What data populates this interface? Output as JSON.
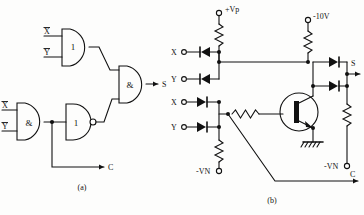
{
  "figure": {
    "caption_a": "(a)",
    "caption_b": "(b)"
  },
  "diagram_a": {
    "name": "half-adder-logic-diagram",
    "inputs": [
      {
        "label": "X",
        "overline": true,
        "gate": "or-top"
      },
      {
        "label": "Y",
        "overline": true,
        "gate": "or-top"
      },
      {
        "label": "X",
        "overline": false,
        "gate": "and-left"
      },
      {
        "label": "Y",
        "overline": false,
        "gate": "and-left"
      }
    ],
    "gates": [
      {
        "id": "or-top",
        "symbol": "1",
        "type": "or",
        "inverted_output": false
      },
      {
        "id": "and-left",
        "symbol": "&",
        "type": "and",
        "inverted_output": false
      },
      {
        "id": "or-mid",
        "symbol": "1",
        "type": "or",
        "inverted_output": true
      },
      {
        "id": "and-out",
        "symbol": "&",
        "type": "and",
        "inverted_output": false
      }
    ],
    "outputs": [
      {
        "label": "S",
        "from": "and-out"
      },
      {
        "label": "C",
        "from": "and-left"
      }
    ]
  },
  "diagram_b": {
    "name": "diode-transistor-implementation",
    "supplies": [
      {
        "label": "+Vp",
        "position": "top-left"
      },
      {
        "label": "-10V",
        "position": "top-right"
      },
      {
        "label": "-VN",
        "position": "bottom-left"
      },
      {
        "label": "-VN",
        "position": "bottom-right"
      }
    ],
    "inputs": [
      {
        "label": "X",
        "row": 1,
        "diode_dir": "left"
      },
      {
        "label": "Y",
        "row": 2,
        "diode_dir": "left"
      },
      {
        "label": "X",
        "row": 3,
        "diode_dir": "right"
      },
      {
        "label": "Y",
        "row": 4,
        "diode_dir": "right"
      }
    ],
    "outputs": [
      {
        "label": "S"
      },
      {
        "label": "C"
      }
    ],
    "components": {
      "transistor": "pnp-transistor",
      "ground": "chassis-ground",
      "resistors": 5,
      "diodes": 6
    }
  }
}
